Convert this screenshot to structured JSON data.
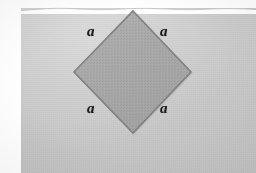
{
  "figure": {
    "caption": "",
    "shape_name": "square",
    "orientation": "rotated-45-diamond",
    "labels": {
      "top_left": "a",
      "top_right": "a",
      "bottom_left": "a",
      "bottom_right": "a"
    },
    "colors": {
      "paper_background": "#c9c9c9",
      "square_fill": "#a9a9a9",
      "square_stroke": "#7e7e7e",
      "label_text": "#1c1c1c",
      "page_margin": "#ffffff"
    },
    "geometry": {
      "top_vertex": [
        133,
        11
      ],
      "right_vertex": [
        191,
        72
      ],
      "bottom_vertex": [
        133,
        133
      ],
      "left_vertex": [
        74,
        72
      ]
    }
  }
}
